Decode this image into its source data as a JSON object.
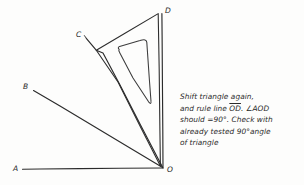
{
  "figure": {
    "background_color": "#fdfdfc",
    "ink_color": "#2b2b2b",
    "points": [
      {
        "id": "A",
        "label": "A",
        "x": 22,
        "y": 169
      },
      {
        "id": "B",
        "label": "B",
        "x": 33,
        "y": 91
      },
      {
        "id": "C",
        "label": "C",
        "x": 86,
        "y": 38
      },
      {
        "id": "D",
        "label": "D",
        "x": 162,
        "y": 13
      },
      {
        "id": "O",
        "label": "O",
        "x": 163,
        "y": 168
      }
    ],
    "rays": [
      {
        "name": "ray-OA",
        "from": "O",
        "to": "A",
        "description": "horizontal base line from O to A"
      },
      {
        "name": "ray-OB",
        "from": "O",
        "to": "B",
        "description": "slanted ray from O to B"
      },
      {
        "name": "ray-OC",
        "from": "O",
        "to": "C",
        "description": "ray from O toward C along set square edge"
      },
      {
        "name": "ray-OD",
        "from": "O",
        "to": "D",
        "description": "vertical line OD being ruled"
      }
    ],
    "set_square": {
      "name": "set-square-triangle",
      "outer_vertices": [
        [
          96,
          50
        ],
        [
          158,
          13
        ],
        [
          160,
          166
        ]
      ],
      "cutout_vertices": [
        [
          118,
          49
        ],
        [
          146,
          40
        ],
        [
          151,
          103
        ]
      ]
    },
    "angle_marked": "AOD",
    "angle_value": "90"
  },
  "note": {
    "lines": [
      "Shift triangle again,",
      "and rule line OD.  ∠AOD",
      "should =90°. Check with",
      "already tested 90°angle",
      "of triangle"
    ],
    "line1": "Shift triangle again,",
    "line2_pre": "and rule line ",
    "line2_overline": "OD",
    "line2_post": ". ∠AOD",
    "line3": "should =90°. Check with",
    "line4": "already tested 90°angle",
    "line5": "of triangle"
  }
}
